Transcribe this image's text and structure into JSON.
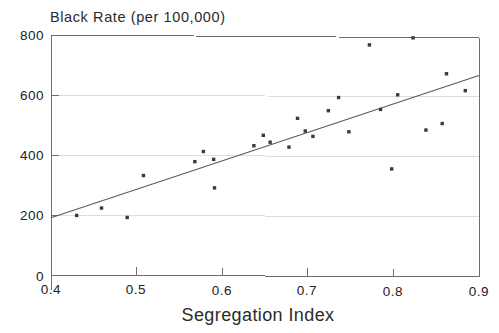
{
  "chart_data": {
    "type": "scatter",
    "title": "",
    "ylabel": "Black Rate (per 100,000)",
    "xlabel": "Segregation Index",
    "xlim": [
      0.4,
      0.9
    ],
    "ylim": [
      0,
      800
    ],
    "xticks": [
      0.4,
      0.5,
      0.6,
      0.7,
      0.8,
      0.9
    ],
    "xtick_labels": [
      "0.4",
      "0.5",
      "0.6",
      "0.7",
      "0.8",
      "0.9"
    ],
    "yticks": [
      0,
      200,
      400,
      600,
      800
    ],
    "ytick_labels": [
      "0",
      "200",
      "400",
      "600",
      "800"
    ],
    "grid": true,
    "legend": "none",
    "marker": "small-filled-square",
    "point_color": "#3a3a3a",
    "line_color": "#5a5a5a",
    "frame_color": "#6e6e6e",
    "grid_color": "#dddddd",
    "x": [
      0.43,
      0.459,
      0.489,
      0.508,
      0.568,
      0.578,
      0.59,
      0.591,
      0.637,
      0.648,
      0.656,
      0.678,
      0.688,
      0.697,
      0.706,
      0.724,
      0.736,
      0.748,
      0.772,
      0.785,
      0.798,
      0.805,
      0.823,
      0.838,
      0.857,
      0.862,
      0.884
    ],
    "y": [
      199,
      224,
      193,
      333,
      380,
      414,
      388,
      293,
      434,
      469,
      446,
      430,
      526,
      484,
      466,
      552,
      596,
      482,
      772,
      557,
      359,
      606,
      796,
      489,
      511,
      677,
      621
    ],
    "points": [
      {
        "x": 0.43,
        "y": 199
      },
      {
        "x": 0.459,
        "y": 224
      },
      {
        "x": 0.489,
        "y": 193
      },
      {
        "x": 0.508,
        "y": 333
      },
      {
        "x": 0.568,
        "y": 380
      },
      {
        "x": 0.578,
        "y": 414
      },
      {
        "x": 0.59,
        "y": 388
      },
      {
        "x": 0.591,
        "y": 293
      },
      {
        "x": 0.637,
        "y": 434
      },
      {
        "x": 0.648,
        "y": 469
      },
      {
        "x": 0.656,
        "y": 446
      },
      {
        "x": 0.678,
        "y": 430
      },
      {
        "x": 0.688,
        "y": 526
      },
      {
        "x": 0.697,
        "y": 484
      },
      {
        "x": 0.706,
        "y": 466
      },
      {
        "x": 0.724,
        "y": 552
      },
      {
        "x": 0.736,
        "y": 596
      },
      {
        "x": 0.748,
        "y": 482
      },
      {
        "x": 0.772,
        "y": 772
      },
      {
        "x": 0.785,
        "y": 557
      },
      {
        "x": 0.798,
        "y": 359
      },
      {
        "x": 0.805,
        "y": 606
      },
      {
        "x": 0.823,
        "y": 796
      },
      {
        "x": 0.838,
        "y": 489
      },
      {
        "x": 0.857,
        "y": 511
      },
      {
        "x": 0.862,
        "y": 677
      },
      {
        "x": 0.884,
        "y": 621
      }
    ],
    "fit_line": {
      "label": "least-squares fit",
      "x_start": 0.4,
      "y_start": 191,
      "x_end": 0.9,
      "y_end": 672
    }
  }
}
